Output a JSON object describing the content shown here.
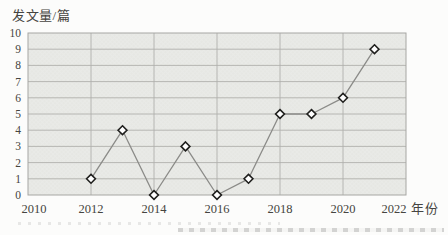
{
  "title": "发文量/篇",
  "x_unit_label": "年份",
  "chart_data": {
    "type": "line",
    "title": "发文量/篇",
    "x": [
      2012,
      2013,
      2014,
      2015,
      2016,
      2017,
      2018,
      2019,
      2020,
      2021
    ],
    "values": [
      1,
      4,
      0,
      3,
      0,
      1,
      5,
      5,
      6,
      9
    ],
    "xlabel": "年份",
    "ylabel": "发文量/篇",
    "xlim": [
      2010,
      2022
    ],
    "ylim": [
      0,
      10
    ],
    "x_ticks": [
      2010,
      2012,
      2014,
      2016,
      2018,
      2020,
      2022
    ],
    "y_ticks": [
      0,
      1,
      2,
      3,
      4,
      5,
      6,
      7,
      8,
      9,
      10
    ],
    "grid": true,
    "legend": null,
    "marker": "open-diamond"
  },
  "colors": {
    "background": "#fcfcfb",
    "plot_fill": "#e9eae7",
    "gridline": "#b0b0ad",
    "plot_border": "#a6a6a3",
    "line": "#8b8b88",
    "marker_fill": "#ffffff",
    "marker_stroke": "#1f1f1d",
    "text": "#454440"
  },
  "bottom_edge_artifact": "faint top sliver of a cropped caption text line"
}
